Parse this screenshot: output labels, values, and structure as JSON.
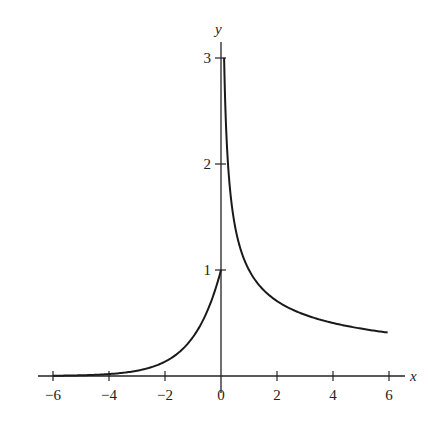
{
  "chart_data": {
    "type": "line",
    "title": "",
    "xlabel": "x",
    "ylabel": "y",
    "xlim": [
      -6,
      6
    ],
    "ylim": [
      0,
      3
    ],
    "grid": false,
    "legend": null,
    "x_ticks": [
      -6,
      -4,
      -2,
      0,
      2,
      4,
      6
    ],
    "x_tick_labels": [
      "−6",
      "−4",
      "−2",
      "0",
      "2",
      "4",
      "6"
    ],
    "y_ticks": [
      1,
      2,
      3
    ],
    "y_tick_labels": [
      "1",
      "2",
      "3"
    ],
    "series": [
      {
        "name": "left branch (e^x, x ≤ 0)",
        "x": [
          -6,
          -5,
          -4,
          -3,
          -2,
          -1.5,
          -1,
          -0.5,
          0
        ],
        "y": [
          0.0025,
          0.0067,
          0.018,
          0.05,
          0.135,
          0.223,
          0.368,
          0.607,
          1.0
        ]
      },
      {
        "name": "right branch (1/√x, x > 0)",
        "x": [
          0.111,
          0.15,
          0.25,
          0.5,
          1,
          1.5,
          2,
          3,
          4,
          5,
          6
        ],
        "y": [
          3.0,
          2.58,
          2.0,
          1.414,
          1.0,
          0.816,
          0.707,
          0.577,
          0.5,
          0.447,
          0.408
        ]
      }
    ],
    "annotations": []
  },
  "axes": {
    "x_label": "x",
    "y_label": "y"
  }
}
